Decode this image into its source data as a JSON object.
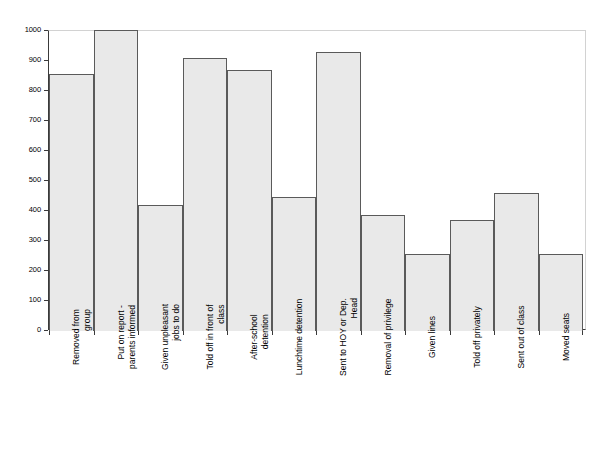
{
  "chart_data": {
    "type": "bar",
    "title": "",
    "subtitle": "",
    "xlabel": "",
    "ylabel": "",
    "ylim": [
      0,
      1000
    ],
    "ytick_step": 100,
    "grid": false,
    "legend": null,
    "orientation": "vertical",
    "bar_fill_color": "#e9e9e9",
    "bar_border_color": "#5a5a5a",
    "axis_color": "#3a3a3a",
    "frame_light_color": "#d2d2d2",
    "label_rotation_degrees": 90,
    "categories": [
      "Removed from group",
      "Put on report - parents informed",
      "Given unpleasant jobs to do",
      "Told off in front of class",
      "After-school detention",
      "Lunchtime detention",
      "Sent to HOY or Dep. Head",
      "Removal of privilege",
      "Given lines",
      "Told off privately",
      "Sent out of class",
      "Moved seats"
    ],
    "category_label_lines": [
      [
        "Removed from",
        "group"
      ],
      [
        "Put on report -",
        "parents informed"
      ],
      [
        "Given unpleasant",
        "jobs to do"
      ],
      [
        "Told off in front of",
        "class"
      ],
      [
        "After-school",
        "detention"
      ],
      [
        "Lunchtime detention"
      ],
      [
        "Sent to HOY or Dep.",
        "Head"
      ],
      [
        "Removal of privilege"
      ],
      [
        "Given lines"
      ],
      [
        "Told off privately"
      ],
      [
        "Sent out of class"
      ],
      [
        "Moved seats"
      ]
    ],
    "values": [
      855,
      1000,
      417,
      908,
      867,
      443,
      927,
      385,
      252,
      367,
      458,
      252
    ],
    "ytick_labels": [
      "0",
      "100",
      "200",
      "300",
      "400",
      "500",
      "600",
      "700",
      "800",
      "900",
      "1000"
    ],
    "ytick_values": [
      0,
      100,
      200,
      300,
      400,
      500,
      600,
      700,
      800,
      900,
      1000
    ]
  }
}
